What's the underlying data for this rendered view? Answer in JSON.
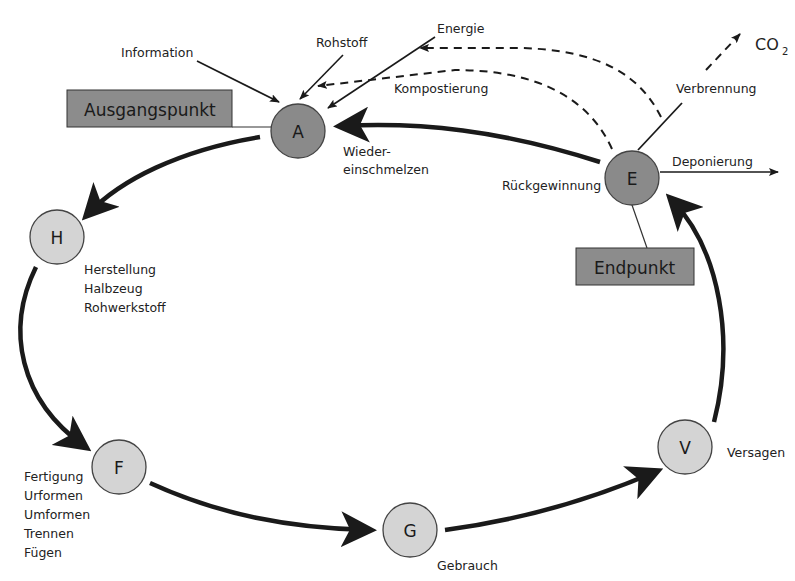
{
  "diagram": {
    "colors": {
      "node_dark": "#8a8a8a",
      "node_light": "#d4d4d4",
      "box_fill": "#8c8c8c",
      "stroke": "#1a1a1a"
    },
    "boxes": {
      "start": "Ausgangspunkt",
      "end": "Endpunkt"
    },
    "nodes": {
      "A": {
        "letter": "A",
        "label_lines": [
          "Wieder-",
          "einschmelzen"
        ]
      },
      "H": {
        "letter": "H",
        "label_lines": [
          "Herstellung",
          "Halbzeug",
          "Rohwerkstoff"
        ]
      },
      "F": {
        "letter": "F",
        "label_lines": [
          "Fertigung",
          "Urformen",
          "Umformen",
          "Trennen",
          "Fügen"
        ]
      },
      "G": {
        "letter": "G",
        "label": "Gebrauch"
      },
      "V": {
        "letter": "V",
        "label": "Versagen"
      },
      "E": {
        "letter": "E",
        "label": "Rückgewinnung"
      }
    },
    "inputs": {
      "information": "Information",
      "rohstoff": "Rohstoff",
      "energie": "Energie"
    },
    "outputs": {
      "kompostierung": "Kompostierung",
      "verbrennung": "Verbrennung",
      "deponierung": "Deponierung",
      "co2_main": "CO",
      "co2_sub": "2"
    }
  }
}
